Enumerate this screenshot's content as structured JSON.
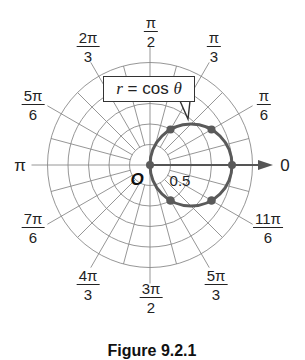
{
  "chart_data": {
    "type": "polar-line",
    "title": "",
    "equation": "r = cos θ",
    "equation_parts": {
      "var": "r",
      "op": "=",
      "func": "cos",
      "arg": "θ"
    },
    "origin_label": "O",
    "radial_tick_label": "0.5",
    "polar_axis_label": "0",
    "radial_grid": [
      0.25,
      0.5,
      0.75,
      1.0,
      1.25
    ],
    "angular_grid_step_deg": 15,
    "angle_labels": [
      {
        "angle_deg": 0,
        "text": "0",
        "num": "",
        "den": ""
      },
      {
        "angle_deg": 30,
        "text": "π/6",
        "num": "π",
        "den": "6"
      },
      {
        "angle_deg": 60,
        "text": "π/3",
        "num": "π",
        "den": "3"
      },
      {
        "angle_deg": 90,
        "text": "π/2",
        "num": "π",
        "den": "2"
      },
      {
        "angle_deg": 120,
        "text": "2π/3",
        "num": "2π",
        "den": "3"
      },
      {
        "angle_deg": 150,
        "text": "5π/6",
        "num": "5π",
        "den": "6"
      },
      {
        "angle_deg": 180,
        "text": "π",
        "num": "",
        "den": ""
      },
      {
        "angle_deg": 210,
        "text": "7π/6",
        "num": "7π",
        "den": "6"
      },
      {
        "angle_deg": 240,
        "text": "4π/3",
        "num": "4π",
        "den": "3"
      },
      {
        "angle_deg": 270,
        "text": "3π/2",
        "num": "3π",
        "den": "2"
      },
      {
        "angle_deg": 300,
        "text": "5π/3",
        "num": "5π",
        "den": "3"
      },
      {
        "angle_deg": 330,
        "text": "11π/6",
        "num": "11π",
        "den": "6"
      }
    ],
    "plotted_points": [
      {
        "theta": "0",
        "r": 1.0
      },
      {
        "theta": "π/6",
        "r": 0.866
      },
      {
        "theta": "π/3",
        "r": 0.5
      },
      {
        "theta": "π/2",
        "r": 0.0
      },
      {
        "theta": "5π/3",
        "r": 0.5
      },
      {
        "theta": "11π/6",
        "r": 0.866
      }
    ],
    "curve": {
      "shape": "circle",
      "center_cartesian": [
        0.5,
        0
      ],
      "radius": 0.5
    },
    "colors": {
      "curve": "#5a5a5a",
      "grid": "#8a8a8a",
      "axis": "#555555",
      "text": "#222222"
    }
  },
  "labels": {
    "pi": "π",
    "zero": "0",
    "origin": "O",
    "tick": "0.5",
    "eq_var": "r",
    "eq_rest": " = cos ",
    "eq_theta": "θ"
  },
  "caption": "Figure 9.2.1"
}
